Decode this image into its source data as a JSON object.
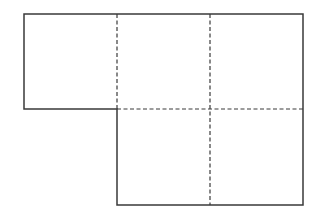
{
  "diagram": {
    "type": "grid-net",
    "colors": {
      "background": "#ffffff",
      "stroke": "#3a3a3a"
    },
    "stroke": {
      "solid_width": 1.5,
      "dashed_width": 1.2,
      "dash_pattern": "4 2.5"
    },
    "grid": {
      "cols_x": [
        24,
        117,
        210,
        303
      ],
      "rows_y": [
        14,
        109,
        205
      ]
    },
    "cells": [
      {
        "row": 0,
        "col": 0
      },
      {
        "row": 0,
        "col": 1
      },
      {
        "row": 0,
        "col": 2
      },
      {
        "row": 1,
        "col": 1
      },
      {
        "row": 1,
        "col": 2
      }
    ],
    "outline_points": "24,14 303,14 303,205 117,205 117,109 24,109",
    "dashed_lines": [
      {
        "x1": 117,
        "y1": 14,
        "x2": 117,
        "y2": 109
      },
      {
        "x1": 210,
        "y1": 14,
        "x2": 210,
        "y2": 205
      },
      {
        "x1": 117,
        "y1": 109,
        "x2": 303,
        "y2": 109
      }
    ]
  }
}
